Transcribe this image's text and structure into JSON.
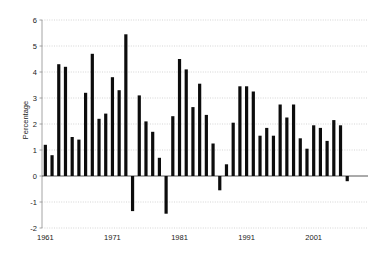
{
  "chart_data": {
    "type": "bar",
    "title": "",
    "subtitle": "",
    "xlabel": "",
    "ylabel": "Percentage",
    "ylim": [
      -2,
      6
    ],
    "yticks": [
      -2,
      -1,
      0,
      1,
      2,
      3,
      4,
      5,
      6
    ],
    "ytick_labels": [
      "-2",
      "-1",
      "0",
      "1",
      "2",
      "3",
      "4",
      "5",
      "6"
    ],
    "xticks": [
      1961,
      1971,
      1981,
      1991,
      2001
    ],
    "xtick_labels": [
      "1961",
      "1971",
      "1981",
      "1991",
      "2001"
    ],
    "xlim": [
      1960.3,
      2008.7
    ],
    "grid": true,
    "grid_axis": "y",
    "legend": false,
    "legend_position": "none",
    "bar_color": "#0c0c0c",
    "categories": [
      "1961",
      "1962",
      "1963",
      "1964",
      "1965",
      "1966",
      "1967",
      "1968",
      "1969",
      "1970",
      "1971",
      "1972",
      "1973",
      "1974",
      "1975",
      "1976",
      "1977",
      "1978",
      "1979",
      "1980",
      "1981",
      "1982",
      "1983",
      "1984",
      "1985",
      "1986",
      "1987",
      "1988",
      "1989",
      "1990",
      "1991",
      "1992",
      "1993",
      "1994",
      "1995",
      "1996",
      "1997",
      "1998",
      "1999",
      "2000",
      "2001",
      "2002",
      "2003",
      "2004",
      "2005",
      "2006",
      "2007",
      "2008"
    ],
    "values": [
      1.2,
      0.8,
      4.3,
      4.2,
      1.5,
      1.4,
      3.2,
      4.7,
      2.2,
      2.4,
      3.8,
      3.3,
      5.45,
      -1.35,
      3.1,
      2.1,
      1.7,
      0.7,
      -1.45,
      2.3,
      4.5,
      4.1,
      2.65,
      3.55,
      2.35,
      1.25,
      -0.55,
      0.45,
      2.05,
      3.45,
      3.45,
      3.25,
      1.55,
      1.85,
      1.55,
      2.75,
      2.25,
      2.75,
      1.45,
      1.05,
      1.95,
      1.85,
      1.35,
      2.15,
      1.95,
      -0.2,
      0,
      0
    ],
    "series": [
      {
        "name": "Percentage",
        "values": [
          1.2,
          0.8,
          4.3,
          4.2,
          1.5,
          1.4,
          3.2,
          4.7,
          2.2,
          2.4,
          3.8,
          3.3,
          5.45,
          -1.35,
          3.1,
          2.1,
          1.7,
          0.7,
          -1.45,
          2.3,
          4.5,
          4.1,
          2.65,
          3.55,
          2.35,
          1.25,
          -0.55,
          0.45,
          2.05,
          3.45,
          3.45,
          3.25,
          1.55,
          1.85,
          1.55,
          2.75,
          2.25,
          2.75,
          1.45,
          1.05,
          1.95,
          1.85,
          1.35,
          2.15,
          1.95,
          -0.2,
          0,
          0
        ]
      }
    ]
  }
}
